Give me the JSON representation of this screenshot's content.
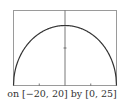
{
  "caption": "on [−20, 20] by [0, 25]",
  "colors": {
    "frame": "#9a9a9a",
    "curve": "#333333",
    "axis": "#555555",
    "bg": "#ffffff"
  },
  "chart_data": {
    "type": "line",
    "title": "",
    "xlabel": "",
    "ylabel": "",
    "xlim": [
      -20,
      20
    ],
    "ylim": [
      0,
      25
    ],
    "grid": false,
    "legend": null,
    "x_ticks": [
      -10,
      0,
      10
    ],
    "y_ticks": [
      12.5
    ],
    "annotations": [
      "on [−20, 20] by [0, 25]"
    ],
    "series": [
      {
        "name": "y = sqrt(400 - x^2)",
        "x": [
          -20,
          -19,
          -18,
          -16,
          -14,
          -12,
          -10,
          -8,
          -6,
          -4,
          -2,
          0,
          2,
          4,
          6,
          8,
          10,
          12,
          14,
          16,
          18,
          19,
          20
        ],
        "y": [
          0,
          6.24,
          8.72,
          12,
          14.28,
          16,
          17.32,
          18.33,
          19.08,
          19.6,
          19.9,
          20,
          19.9,
          19.6,
          19.08,
          18.33,
          17.32,
          16,
          14.28,
          12,
          8.72,
          6.24,
          0
        ]
      }
    ]
  }
}
